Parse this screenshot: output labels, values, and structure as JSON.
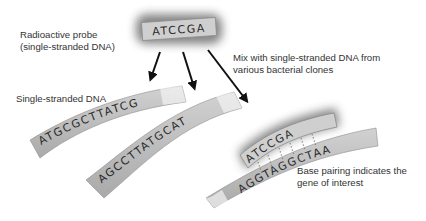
{
  "labels": {
    "probe_line1": "Radioactive probe",
    "probe_line2": "(single-stranded DNA)",
    "mix_line1": "Mix with single-stranded DNA from",
    "mix_line2": "various bacterial clones",
    "ss_dna": "Single-stranded DNA",
    "pairing_line1": "Base pairing indicates the",
    "pairing_line2": "gene of interest"
  },
  "probe": {
    "sequence": "ATCCGA"
  },
  "strands": [
    {
      "sequence": "ATGCGCTTATCG"
    },
    {
      "sequence": "AGCCTTATGCAT"
    },
    {
      "sequence": "AGGTAGGCTAA"
    }
  ],
  "bound_probe": {
    "sequence": "ATCCGA"
  },
  "colors": {
    "strand_fill": "#b9b9b9",
    "strand_highlight": "#d6d6d6",
    "probe_glow": "#8a8a8a",
    "arrow": "#111111",
    "text": "#333333"
  }
}
